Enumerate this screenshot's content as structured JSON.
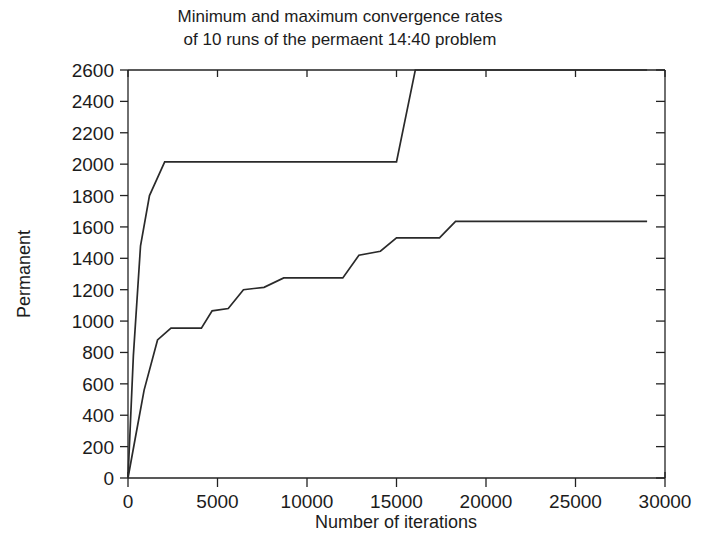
{
  "chart_data": {
    "type": "line",
    "title": "Minimum and maximum convergence rates of 10 runs of the permaent 14:40 problem",
    "title_line1": "Minimum and maximum convergence rates",
    "title_line2": "of 10 runs of the permaent 14:40 problem",
    "xlabel": "Number of iterations",
    "ylabel": "Permanent",
    "xlim": [
      0,
      30000
    ],
    "ylim": [
      0,
      2600
    ],
    "xticks": [
      0,
      5000,
      10000,
      15000,
      20000,
      25000,
      30000
    ],
    "xtick_labels": [
      "0",
      "5000",
      "10000",
      "15000",
      "20000",
      "25000",
      "30000"
    ],
    "yticks": [
      0,
      200,
      400,
      600,
      800,
      1000,
      1200,
      1400,
      1600,
      1800,
      2000,
      2200,
      2400,
      2600
    ],
    "ytick_labels": [
      "0",
      "200",
      "400",
      "600",
      "800",
      "1000",
      "1200",
      "1400",
      "1600",
      "1800",
      "2000",
      "2200",
      "2400",
      "2600"
    ],
    "grid": false,
    "legend": "none",
    "minor_yticks_right": true,
    "series": [
      {
        "name": "maximum convergence rate",
        "color": "#2a2a2a",
        "points": [
          [
            0,
            0
          ],
          [
            300,
            780
          ],
          [
            700,
            1480
          ],
          [
            1200,
            1800
          ],
          [
            2050,
            2015
          ],
          [
            15000,
            2015
          ],
          [
            16050,
            2600
          ],
          [
            29000,
            2600
          ]
        ]
      },
      {
        "name": "minimum convergence rate",
        "color": "#2a2a2a",
        "points": [
          [
            0,
            0
          ],
          [
            400,
            250
          ],
          [
            900,
            560
          ],
          [
            1650,
            880
          ],
          [
            2400,
            955
          ],
          [
            4100,
            955
          ],
          [
            4700,
            1065
          ],
          [
            5600,
            1080
          ],
          [
            6450,
            1200
          ],
          [
            7600,
            1215
          ],
          [
            8700,
            1275
          ],
          [
            12000,
            1275
          ],
          [
            12900,
            1420
          ],
          [
            14100,
            1445
          ],
          [
            15000,
            1530
          ],
          [
            17400,
            1530
          ],
          [
            18300,
            1635
          ],
          [
            29000,
            1635
          ]
        ]
      }
    ]
  },
  "layout": {
    "plot_left_px": 128,
    "plot_right_px": 665,
    "plot_top_px": 70,
    "plot_bottom_px": 478
  }
}
